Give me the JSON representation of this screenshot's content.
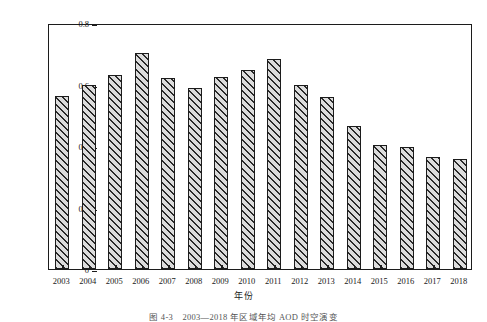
{
  "chart_data": {
    "type": "bar",
    "title": "",
    "xlabel": "年份",
    "ylabel": "AOD",
    "categories": [
      "2003",
      "2004",
      "2005",
      "2006",
      "2007",
      "2008",
      "2009",
      "2010",
      "2011",
      "2012",
      "2013",
      "2014",
      "2015",
      "2016",
      "2017",
      "2018"
    ],
    "values": [
      0.562,
      0.6,
      0.63,
      0.702,
      0.621,
      0.59,
      0.624,
      0.646,
      0.684,
      0.597,
      0.558,
      0.465,
      0.403,
      0.396,
      0.363,
      0.357
    ],
    "ylim": [
      0,
      0.8
    ],
    "xlim_note": "categorical",
    "ytick_labels": [
      "0",
      "0.2",
      "0.4",
      "0.6",
      "0.8"
    ],
    "ytick_values": [
      0,
      0.2,
      0.4,
      0.6,
      0.8
    ],
    "grid": false,
    "legend": false,
    "legend_position": "none",
    "bar_fill_color": "#dcdcdc",
    "bar_edge_color": "#1c1c1c",
    "bar_hatch": "diagonal-forward",
    "axis_color": "#1c1c1c"
  },
  "caption": "图 4-3　2003—2018 年区域年均 AOD 时空演变"
}
